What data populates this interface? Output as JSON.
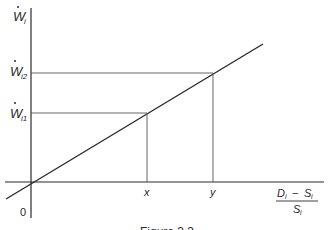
{
  "diagram": {
    "y_axis_label": {
      "main": "W",
      "sub": "i",
      "dot": true
    },
    "x_axis_label": {
      "numerator": {
        "a": "D",
        "a_sub": "i",
        "op": "−",
        "b": "S",
        "b_sub": "i"
      },
      "denominator": {
        "a": "S",
        "a_sub": "i"
      }
    },
    "origin_label": "0",
    "y_ticks": [
      {
        "main": "W",
        "sub": "i2",
        "dot": true
      },
      {
        "main": "W",
        "sub": "i1",
        "dot": true
      }
    ],
    "x_ticks": [
      "x",
      "y"
    ],
    "caption": "Figure 3.3",
    "colors": {
      "line": "#2a2a2a",
      "guide": "#555555",
      "background": "#ffffff"
    }
  }
}
